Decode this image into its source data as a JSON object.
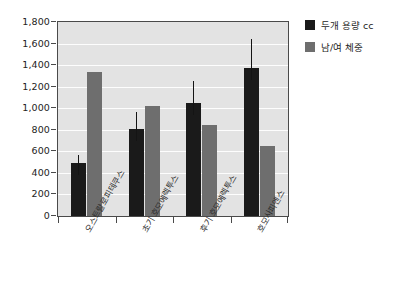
{
  "chart_data": {
    "type": "bar",
    "title": "",
    "subtitle": "",
    "xlabel": "",
    "ylabel": "",
    "ylim": [
      0,
      1800
    ],
    "ytick_step": 200,
    "ytick_labels": [
      "0",
      "200",
      "400",
      "600",
      "800",
      "1,000",
      "1,200",
      "1,400",
      "1,600",
      "1,800"
    ],
    "ytick_values": [
      0,
      200,
      400,
      600,
      800,
      1000,
      1200,
      1400,
      1600,
      1800
    ],
    "grid": true,
    "grid_axis": "y",
    "legend_position": "right",
    "categories": [
      "오스트랄로피테쿠스",
      "초기 호모에렉투스",
      "후기 호모에렉투스",
      "호모사피엔스"
    ],
    "series": [
      {
        "name": "두개 용량 cc",
        "color": "#1a1a1a",
        "values": [
          490,
          810,
          1045,
          1370
        ],
        "error_high": [
          570,
          965,
          1250,
          1645
        ]
      },
      {
        "name": "남/여 체중",
        "color": "#6e6e6e",
        "values": [
          1335,
          1025,
          845,
          650
        ],
        "error_high": [
          null,
          null,
          null,
          null
        ]
      }
    ]
  },
  "legend": {
    "items": [
      {
        "label": "두개 용량 cc",
        "color": "#1a1a1a"
      },
      {
        "label": "남/여 체중",
        "color": "#6e6e6e"
      }
    ]
  },
  "style": {
    "plot_background": "#e3e3e3",
    "gridline_color": "#fdfdfd",
    "axis_color": "#4a4a4a",
    "page_background": "#ffffff"
  }
}
